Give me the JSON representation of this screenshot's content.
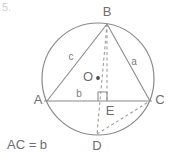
{
  "figure": {
    "kind": "circle-inscribed-triangle-diagram",
    "corner_label": "5.",
    "caption": "AC = b",
    "stroke_color": "#8a8a8a",
    "dashed_color": "#9a9a9a",
    "label_color": "#6e6e6e",
    "background": "#ffffff",
    "circle": {
      "name": "circumcircle",
      "cx": 98,
      "cy": 79,
      "r": 56
    },
    "center": {
      "label": "O",
      "label_x": 88,
      "label_y": 78,
      "dot_x": 98,
      "dot_y": 78,
      "dot_r": 1.9
    },
    "vertices": [
      {
        "id": "A",
        "label": "A",
        "x": 47,
        "y": 101,
        "label_x": 38,
        "label_y": 101
      },
      {
        "id": "B",
        "label": "B",
        "x": 107,
        "y": 24,
        "label_x": 107,
        "label_y": 13
      },
      {
        "id": "C",
        "label": "C",
        "x": 150,
        "y": 101,
        "label_x": 160,
        "label_y": 101
      },
      {
        "id": "D",
        "label": "D",
        "x": 97,
        "y": 134,
        "label_x": 97,
        "label_y": 147
      },
      {
        "id": "E",
        "label": "E",
        "x": 107,
        "y": 101,
        "label_x": 110,
        "label_y": 112
      }
    ],
    "side_labels": [
      {
        "id": "c",
        "label": "c",
        "x": 71,
        "y": 57,
        "for": "AB"
      },
      {
        "id": "a",
        "label": "a",
        "x": 134,
        "y": 62,
        "for": "BC"
      },
      {
        "id": "b",
        "label": "b",
        "x": 79,
        "y": 94,
        "for": "AC"
      }
    ],
    "solid_segments": [
      {
        "name": "segment-AB",
        "x1": 47,
        "y1": 101,
        "x2": 107,
        "y2": 24
      },
      {
        "name": "segment-BC",
        "x1": 107,
        "y1": 24,
        "x2": 150,
        "y2": 101
      },
      {
        "name": "segment-AC",
        "x1": 44,
        "y1": 101,
        "x2": 152,
        "y2": 101
      }
    ],
    "dashed_segments": [
      {
        "name": "segment-BE-altitude",
        "x1": 107,
        "y1": 24,
        "x2": 107,
        "y2": 101
      },
      {
        "name": "segment-BD-diameter",
        "x1": 107,
        "y1": 24,
        "x2": 97,
        "y2": 134
      },
      {
        "name": "segment-DC-chord",
        "x1": 97,
        "y1": 134,
        "x2": 150,
        "y2": 101
      }
    ],
    "right_angle": {
      "name": "right-angle-at-E",
      "x": 107,
      "y": 101,
      "size": 9,
      "direction": "up-left-of-E"
    }
  }
}
